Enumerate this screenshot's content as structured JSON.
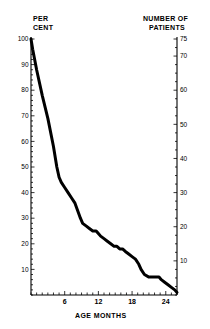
{
  "chart_data": {
    "type": "line",
    "title": "",
    "xlabel": "AGE MONTHS",
    "ylabel": "PER CENT",
    "ylabel_right": "NUMBER OF PATIENTS",
    "ylabel_left_line1": "PER",
    "ylabel_left_line2": "CENT",
    "ylabel_right_line1": "NUMBER OF",
    "ylabel_right_line2": "PATIENTS",
    "xlim": [
      0,
      26
    ],
    "ylim": [
      0,
      100
    ],
    "ylim_right": [
      0,
      75
    ],
    "grid": false,
    "legend": "none",
    "x_ticks_major": [
      6,
      12,
      18,
      24
    ],
    "x_tick_labels": [
      "6",
      "12",
      "18",
      "24"
    ],
    "x_ticks_minor_step": 1,
    "y_ticks_left": [
      10,
      20,
      30,
      40,
      50,
      60,
      70,
      80,
      90,
      100
    ],
    "y_tick_labels_left": [
      "10",
      "20",
      "30",
      "40",
      "50",
      "60",
      "70",
      "80",
      "90",
      "100"
    ],
    "y_ticks_right": [
      10,
      20,
      30,
      40,
      50,
      60,
      70,
      75
    ],
    "y_tick_labels_right": [
      "10",
      "20",
      "30",
      "40",
      "50",
      "60",
      "70",
      "75"
    ],
    "y_ticks_right_minor_step": 2.5,
    "series": [
      {
        "name": "patients remaining",
        "x": [
          0.0,
          0.3,
          1.0,
          2.0,
          3.0,
          4.0,
          4.6,
          5.0,
          5.4,
          6.0,
          6.6,
          7.2,
          7.8,
          8.3,
          8.8,
          9.2,
          9.8,
          10.4,
          11.0,
          11.6,
          12.0,
          12.4,
          13.0,
          13.6,
          14.2,
          14.8,
          15.3,
          15.8,
          16.3,
          16.8,
          17.4,
          18.0,
          18.6,
          19.2,
          19.6,
          20.2,
          21.0,
          22.0,
          22.8,
          23.2,
          23.8,
          24.4,
          25.0,
          25.6,
          26.0
        ],
        "y": [
          100,
          96,
          88,
          78,
          69,
          58,
          50,
          46,
          44,
          42,
          40,
          38,
          36,
          33,
          30,
          28,
          27,
          26,
          25,
          25,
          24,
          23,
          22,
          21,
          20,
          19,
          19,
          18,
          18,
          17,
          16,
          15,
          14,
          12,
          10,
          8,
          7,
          7,
          7,
          6,
          5,
          4,
          3,
          2,
          1
        ],
        "color": "#000000",
        "linewidth": 3
      }
    ]
  },
  "axes": {
    "left_axis_name": "per-cent-axis",
    "right_axis_name": "number-of-patients-axis",
    "bottom_axis_name": "age-months-axis"
  }
}
